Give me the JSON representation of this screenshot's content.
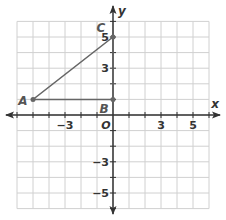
{
  "diagram": {
    "type": "coordinate-plane",
    "axes": {
      "x_label": "x",
      "y_label": "y",
      "origin_label": "O",
      "x_range": [
        -6,
        6
      ],
      "y_range": [
        -6,
        6
      ],
      "x_tick_labels": [
        {
          "value": -3,
          "text": "−3"
        },
        {
          "value": 3,
          "text": "3"
        },
        {
          "value": 5,
          "text": "5"
        }
      ],
      "y_tick_labels": [
        {
          "value": 5,
          "text": "5"
        },
        {
          "value": 3,
          "text": "3"
        },
        {
          "value": -3,
          "text": "−3"
        },
        {
          "value": -5,
          "text": "−5"
        }
      ]
    },
    "points": [
      {
        "label": "A",
        "x": -5,
        "y": 1
      },
      {
        "label": "B",
        "x": 0,
        "y": 1
      },
      {
        "label": "C",
        "x": 0,
        "y": 5
      }
    ],
    "shape": {
      "name": "triangle ABC",
      "vertices": [
        "A",
        "B",
        "C"
      ]
    },
    "colors": {
      "grid": "#d0d0d0",
      "axis": "#333333",
      "triangle": "#666666",
      "labels": "#333333"
    }
  }
}
